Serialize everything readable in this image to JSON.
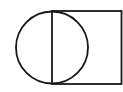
{
  "diagram": {
    "stroke_color": "#1a1a1a",
    "background_color": "#ffffff",
    "shapes": [
      "circle",
      "vertical-diameter",
      "rectangle"
    ]
  }
}
